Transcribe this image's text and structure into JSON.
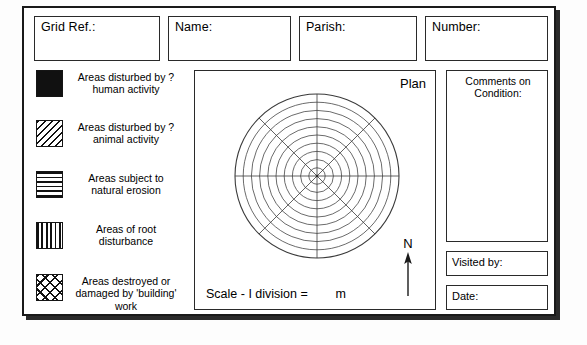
{
  "form": {
    "title": "Tree Survey Record Form"
  },
  "header": {
    "fields": [
      {
        "label": "Grid Ref.:",
        "value": "",
        "name": "grid-ref"
      },
      {
        "label": "Name:",
        "value": "",
        "name": "name"
      },
      {
        "label": "Parish:",
        "value": "",
        "name": "parish"
      },
      {
        "label": "Number:",
        "value": "",
        "name": "number"
      }
    ]
  },
  "legend": {
    "items": [
      {
        "pattern": "solid-black",
        "text": "Areas disturbed by\n? human activity"
      },
      {
        "pattern": "diagonal-hatch",
        "text": "Areas disturbed by\n? animal activity"
      },
      {
        "pattern": "horizontal-lines",
        "text": "Areas subject to\nnatural erosion"
      },
      {
        "pattern": "vertical-lines",
        "text": "Areas of root\ndisturbance"
      },
      {
        "pattern": "cross-hatch",
        "text": "Areas destroyed or\ndamaged by\n'building' work"
      }
    ]
  },
  "plan": {
    "label": "Plan",
    "scale_text": "Scale - I division =        m",
    "north_letter": "N"
  },
  "chart_data": {
    "type": "polar-grid",
    "title": "Plan",
    "rings": 10,
    "ring_radii_px": [
      8.2,
      16.4,
      24.6,
      32.8,
      41,
      49.2,
      57.4,
      65.6,
      73.8,
      82
    ],
    "spoke_angles_deg": [
      0,
      45,
      90,
      135,
      180,
      225,
      270,
      315
    ],
    "outer_radius_px": 82,
    "center_px": [
      84,
      84
    ],
    "grid": true,
    "values": [],
    "categories": [],
    "annotations": [
      "Plan",
      "N",
      "Scale - I division =        m"
    ]
  },
  "sidebar": {
    "comments_label": "Comments on\nCondition:",
    "visited_label": "Visited by:",
    "date_label": "Date:",
    "comments_value": "",
    "visited_value": "",
    "date_value": ""
  },
  "colors": {
    "ink": "#111111",
    "border": "#2a2a2a",
    "paper": "#ffffff",
    "shadow": "#2b2b2b"
  }
}
